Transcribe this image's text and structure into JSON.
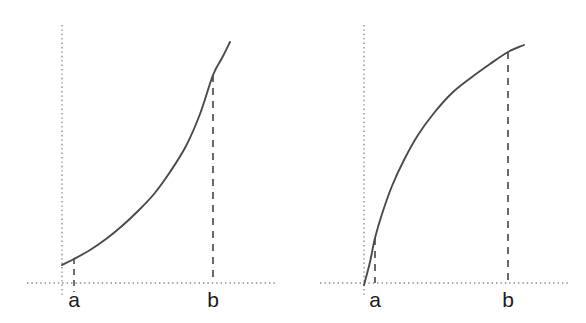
{
  "figure": {
    "background_color": "#ffffff",
    "curve_color": "#4a4a4a",
    "axis_color": "#8a8a8a",
    "marker_color": "#595959",
    "label_color": "#1c1c1c"
  },
  "panels": [
    {
      "id": "left",
      "curve_shape": "convex-increasing",
      "labels": {
        "a": "a",
        "b": "b"
      },
      "a_marker_style": "short-dashed-tick",
      "b_marker_style": "full-dashed-line"
    },
    {
      "id": "right",
      "curve_shape": "concave-increasing",
      "labels": {
        "a": "a",
        "b": "b"
      },
      "a_marker_style": "full-dashed-line",
      "b_marker_style": "full-dashed-line"
    }
  ],
  "chart_data": {
    "type": "line",
    "title": "",
    "xlabel": "",
    "ylabel": "",
    "grid": false,
    "legend_position": "none",
    "panel_count": 2,
    "charts": [
      {
        "id": "left-chart",
        "type": "line",
        "shape": "convex-increasing",
        "description": "Increasing convex curve rising from near the vertical dotted axis to the upper right",
        "xlim": [
          27,
          275
        ],
        "ylim": [
          283,
          25
        ],
        "annotations": [
          {
            "label": "a",
            "x": 74,
            "marker": "short-dashed-tick",
            "tick_top": 258,
            "tick_bottom": 292
          },
          {
            "label": "b",
            "x": 213,
            "marker": "dashed-line",
            "line_top": 75,
            "line_bottom": 283
          }
        ],
        "axes": {
          "x_axis": {
            "style": "dotted",
            "y": 283,
            "x_start": 27,
            "x_end": 275
          },
          "y_axis": {
            "style": "dotted",
            "x": 62,
            "y_start": 25,
            "y_end": 295
          }
        },
        "points": [
          {
            "x": 62,
            "y": 265
          },
          {
            "x": 74,
            "y": 259
          },
          {
            "x": 90,
            "y": 250
          },
          {
            "x": 106,
            "y": 239
          },
          {
            "x": 122,
            "y": 226
          },
          {
            "x": 138,
            "y": 211
          },
          {
            "x": 154,
            "y": 194
          },
          {
            "x": 170,
            "y": 172
          },
          {
            "x": 186,
            "y": 146
          },
          {
            "x": 200,
            "y": 114
          },
          {
            "x": 213,
            "y": 75
          },
          {
            "x": 222,
            "y": 58
          },
          {
            "x": 230,
            "y": 42
          }
        ]
      },
      {
        "id": "right-chart",
        "type": "line",
        "shape": "concave-increasing",
        "description": "Increasing concave curve rising steeply from the axis then flattening toward the upper right",
        "xlim": [
          320,
          568
        ],
        "ylim": [
          283,
          25
        ],
        "annotations": [
          {
            "label": "a",
            "x": 375,
            "marker": "dashed-line",
            "line_top": 238,
            "line_bottom": 283
          },
          {
            "label": "b",
            "x": 508,
            "marker": "dashed-line",
            "line_top": 52,
            "line_bottom": 283
          }
        ],
        "axes": {
          "x_axis": {
            "style": "dotted",
            "y": 283,
            "x_start": 320,
            "x_end": 568
          },
          "y_axis": {
            "style": "dotted",
            "x": 364,
            "y_start": 25,
            "y_end": 295
          }
        },
        "points": [
          {
            "x": 364,
            "y": 285
          },
          {
            "x": 370,
            "y": 262
          },
          {
            "x": 375,
            "y": 238
          },
          {
            "x": 382,
            "y": 214
          },
          {
            "x": 392,
            "y": 186
          },
          {
            "x": 404,
            "y": 160
          },
          {
            "x": 418,
            "y": 135
          },
          {
            "x": 434,
            "y": 113
          },
          {
            "x": 452,
            "y": 93
          },
          {
            "x": 472,
            "y": 77
          },
          {
            "x": 490,
            "y": 64
          },
          {
            "x": 508,
            "y": 52
          },
          {
            "x": 524,
            "y": 45
          }
        ]
      }
    ]
  }
}
